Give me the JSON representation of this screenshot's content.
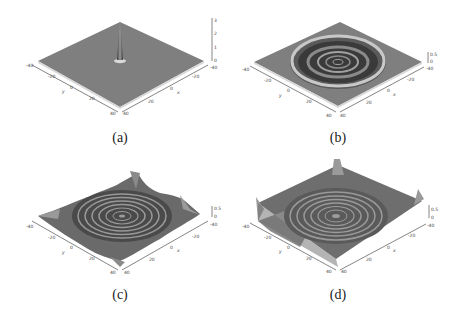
{
  "figure": {
    "panels": [
      {
        "id": "a",
        "caption": "(a)",
        "description": "single sharp central peak on flat surface",
        "axes": {
          "y_label": "y",
          "x_label": "x",
          "y_ticks": [
            "-40",
            "-20",
            "0",
            "20",
            "40"
          ],
          "x_ticks": [
            "40",
            "20",
            "0",
            "-20",
            "-40"
          ],
          "z_ticks": [
            "0",
            "1",
            "2",
            "3"
          ]
        }
      },
      {
        "id": "b",
        "caption": "(b)",
        "description": "expanding ring with inner concentric ripples",
        "axes": {
          "y_label": "y",
          "x_label": "x",
          "y_ticks": [
            "-40",
            "-20",
            "0",
            "20",
            "40"
          ],
          "x_ticks": [
            "40",
            "20",
            "0",
            "-20",
            "-40"
          ],
          "z_ticks": [
            "0",
            "0.5"
          ]
        }
      },
      {
        "id": "c",
        "caption": "(c)",
        "description": "concentric ripples with wave reflections from boundary corners",
        "axes": {
          "y_label": "y",
          "x_label": "x",
          "y_ticks": [
            "-40",
            "-20",
            "0",
            "20",
            "40"
          ],
          "x_ticks": [
            "40",
            "20",
            "0",
            "-20",
            "-40"
          ],
          "z_ticks": [
            "0",
            "0.5"
          ]
        }
      },
      {
        "id": "d",
        "caption": "(d)",
        "description": "concentric ripples with raised corners and boundary disturbances",
        "axes": {
          "y_label": "y",
          "x_label": "x",
          "y_ticks": [
            "-40",
            "-20",
            "0",
            "20",
            "40"
          ],
          "x_ticks": [
            "40",
            "20",
            "0",
            "-20",
            "-40"
          ],
          "z_ticks": [
            "0",
            "0.5"
          ]
        }
      }
    ]
  }
}
